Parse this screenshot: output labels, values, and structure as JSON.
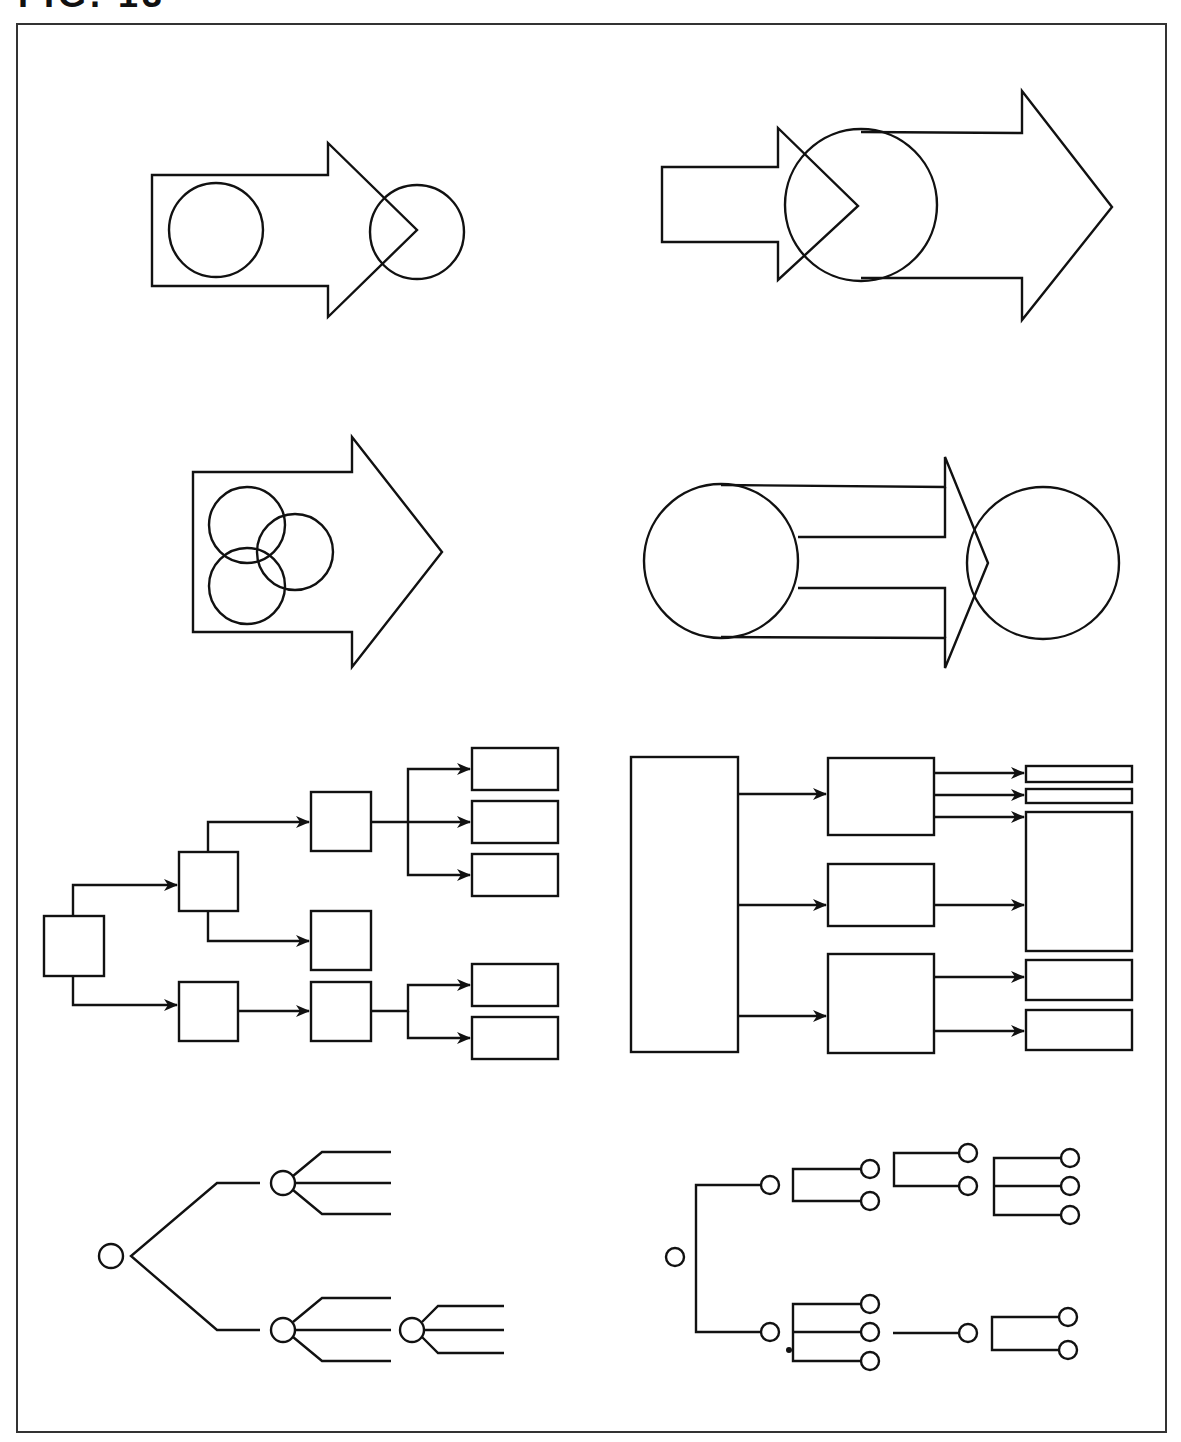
{
  "figure": {
    "label": "FIG. 13",
    "stroke_color": "#111111",
    "background": "#ffffff"
  },
  "panels": [
    {
      "id": "arrow-circle-overlap",
      "position": "top-left",
      "shapes": [
        "block-arrow",
        "circle-inside",
        "circle-at-tip"
      ]
    },
    {
      "id": "arrow-into-big-arrow",
      "position": "top-right",
      "shapes": [
        "small-block-arrow",
        "circle",
        "large-block-arrow"
      ]
    },
    {
      "id": "arrow-three-circles",
      "position": "middle-left",
      "shapes": [
        "block-arrow",
        "three-overlapping-circles"
      ]
    },
    {
      "id": "circle-arrow-circle",
      "position": "middle-right",
      "shapes": [
        "circle",
        "split-block-arrow",
        "circle"
      ]
    },
    {
      "id": "box-tree",
      "position": "lower-left",
      "nodes": 11,
      "type": "hierarchical-flow"
    },
    {
      "id": "block-fanout",
      "position": "lower-right",
      "nodes": 9,
      "type": "block-flow"
    },
    {
      "id": "circle-tree-branching",
      "position": "bottom-left",
      "nodes": 4,
      "type": "node-tree"
    },
    {
      "id": "circle-tree-bracket",
      "position": "bottom-right",
      "nodes": 20,
      "type": "node-tree"
    }
  ]
}
